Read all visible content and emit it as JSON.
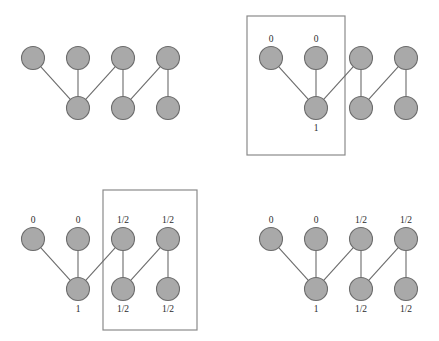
{
  "figure": {
    "node_radius": 11.5,
    "colors": {
      "node_fill": "#a9a9a9",
      "node_stroke": "#6b6b6b",
      "edge": "#6b6b6b",
      "box_stroke": "#8a8a8a",
      "label_text": "#2b2b2b",
      "background": "#ffffff"
    },
    "panels": [
      {
        "id": "top-left",
        "name": "panel-unlabeled",
        "origin": {
          "x": 33,
          "y": 58
        },
        "has_box": false,
        "box": null,
        "top_nodes": [
          {
            "id": "t1",
            "cx": 33,
            "cy": 58,
            "label": ""
          },
          {
            "id": "t2",
            "cx": 78,
            "cy": 58,
            "label": ""
          },
          {
            "id": "t3",
            "cx": 123,
            "cy": 58,
            "label": ""
          },
          {
            "id": "t4",
            "cx": 168,
            "cy": 58,
            "label": ""
          }
        ],
        "bottom_nodes": [
          {
            "id": "b1",
            "cx": 78,
            "cy": 108,
            "label": ""
          },
          {
            "id": "b2",
            "cx": 123,
            "cy": 108,
            "label": ""
          },
          {
            "id": "b3",
            "cx": 168,
            "cy": 108,
            "label": ""
          }
        ],
        "edges": [
          {
            "from": "t1",
            "to": "b1"
          },
          {
            "from": "t2",
            "to": "b1"
          },
          {
            "from": "t3",
            "to": "b1"
          },
          {
            "from": "t3",
            "to": "b2"
          },
          {
            "from": "t4",
            "to": "b2"
          },
          {
            "from": "t4",
            "to": "b3"
          }
        ]
      },
      {
        "id": "top-right",
        "name": "panel-seed-labeled",
        "origin": {
          "x": 271,
          "y": 58
        },
        "has_box": true,
        "box": {
          "x": 247,
          "y": 16,
          "width": 98,
          "height": 139
        },
        "top_nodes": [
          {
            "id": "t1",
            "cx": 271,
            "cy": 58,
            "label": "0"
          },
          {
            "id": "t2",
            "cx": 316,
            "cy": 58,
            "label": "0"
          },
          {
            "id": "t3",
            "cx": 361,
            "cy": 58,
            "label": ""
          },
          {
            "id": "t4",
            "cx": 406,
            "cy": 58,
            "label": ""
          }
        ],
        "bottom_nodes": [
          {
            "id": "b1",
            "cx": 316,
            "cy": 108,
            "label": "1"
          },
          {
            "id": "b2",
            "cx": 361,
            "cy": 108,
            "label": ""
          },
          {
            "id": "b3",
            "cx": 406,
            "cy": 108,
            "label": ""
          }
        ],
        "edges": [
          {
            "from": "t1",
            "to": "b1"
          },
          {
            "from": "t2",
            "to": "b1"
          },
          {
            "from": "t3",
            "to": "b1"
          },
          {
            "from": "t3",
            "to": "b2"
          },
          {
            "from": "t4",
            "to": "b2"
          },
          {
            "from": "t4",
            "to": "b3"
          }
        ]
      },
      {
        "id": "bottom-left",
        "name": "panel-partial-propagated",
        "origin": {
          "x": 33,
          "y": 239
        },
        "has_box": true,
        "box": {
          "x": 103,
          "y": 190,
          "width": 94,
          "height": 140
        },
        "top_nodes": [
          {
            "id": "t1",
            "cx": 33,
            "cy": 239,
            "label": "0"
          },
          {
            "id": "t2",
            "cx": 78,
            "cy": 239,
            "label": "0"
          },
          {
            "id": "t3",
            "cx": 123,
            "cy": 239,
            "label": "1/2"
          },
          {
            "id": "t4",
            "cx": 168,
            "cy": 239,
            "label": "1/2"
          }
        ],
        "bottom_nodes": [
          {
            "id": "b1",
            "cx": 78,
            "cy": 289,
            "label": "1"
          },
          {
            "id": "b2",
            "cx": 123,
            "cy": 289,
            "label": "1/2"
          },
          {
            "id": "b3",
            "cx": 168,
            "cy": 289,
            "label": "1/2"
          }
        ],
        "edges": [
          {
            "from": "t1",
            "to": "b1"
          },
          {
            "from": "t2",
            "to": "b1"
          },
          {
            "from": "t3",
            "to": "b1"
          },
          {
            "from": "t3",
            "to": "b2"
          },
          {
            "from": "t4",
            "to": "b2"
          },
          {
            "from": "t4",
            "to": "b3"
          }
        ]
      },
      {
        "id": "bottom-right",
        "name": "panel-fully-propagated",
        "origin": {
          "x": 271,
          "y": 239
        },
        "has_box": false,
        "box": null,
        "top_nodes": [
          {
            "id": "t1",
            "cx": 271,
            "cy": 239,
            "label": "0"
          },
          {
            "id": "t2",
            "cx": 316,
            "cy": 239,
            "label": "0"
          },
          {
            "id": "t3",
            "cx": 361,
            "cy": 239,
            "label": "1/2"
          },
          {
            "id": "t4",
            "cx": 406,
            "cy": 239,
            "label": "1/2"
          }
        ],
        "bottom_nodes": [
          {
            "id": "b1",
            "cx": 316,
            "cy": 289,
            "label": "1"
          },
          {
            "id": "b2",
            "cx": 361,
            "cy": 289,
            "label": "1/2"
          },
          {
            "id": "b3",
            "cx": 406,
            "cy": 289,
            "label": "1/2"
          }
        ],
        "edges": [
          {
            "from": "t1",
            "to": "b1"
          },
          {
            "from": "t2",
            "to": "b1"
          },
          {
            "from": "t3",
            "to": "b1"
          },
          {
            "from": "t3",
            "to": "b2"
          },
          {
            "from": "t4",
            "to": "b2"
          },
          {
            "from": "t4",
            "to": "b3"
          }
        ]
      }
    ]
  }
}
